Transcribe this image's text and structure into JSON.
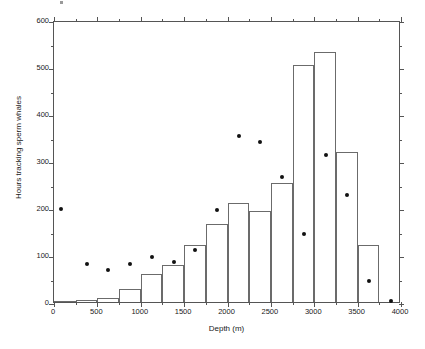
{
  "chart_data": {
    "type": "bar",
    "title": "",
    "xlabel": "Depth (m)",
    "ylabel": "Hours tracking sperm whales",
    "xlim": [
      0,
      4000
    ],
    "ylim": [
      0,
      600
    ],
    "grid": false,
    "legend": "none",
    "x_ticks_major": [
      0,
      500,
      1000,
      1500,
      2000,
      2500,
      3000,
      3500,
      4000
    ],
    "x_tick_labels": [
      "0",
      "500",
      "1000",
      "1500",
      "2000",
      "2500",
      "3000",
      "3500",
      "4000"
    ],
    "x_ticks_minor": [
      250,
      750,
      1250,
      1750,
      2250,
      2750,
      3250,
      3750
    ],
    "y_ticks_major": [
      0,
      100,
      200,
      300,
      400,
      500,
      600
    ],
    "y_tick_labels": [
      "0",
      "100",
      "200",
      "300",
      "400",
      "500",
      "600"
    ],
    "y_ticks_minor": [
      50,
      150,
      250,
      350,
      450,
      550
    ],
    "bin_width": 250,
    "bin_starts": [
      0,
      250,
      500,
      750,
      1000,
      1250,
      1500,
      1750,
      2000,
      2250,
      2500,
      2750,
      3000,
      3250,
      3500
    ],
    "bin_ends": [
      250,
      500,
      750,
      1000,
      1250,
      1500,
      1750,
      2000,
      2250,
      2500,
      2750,
      3000,
      3250,
      3500,
      3750
    ],
    "bin_centers": [
      125,
      375,
      625,
      875,
      1125,
      1375,
      1625,
      1875,
      2125,
      2375,
      2625,
      2875,
      3125,
      3375,
      3625
    ],
    "values": [
      1,
      4,
      8,
      27,
      59,
      79,
      121,
      165,
      210,
      194,
      253,
      504,
      532,
      319,
      121
    ],
    "series": [
      {
        "name": "Hours tracking sperm whales",
        "type": "bar",
        "values": [
          1,
          4,
          8,
          27,
          59,
          79,
          121,
          165,
          210,
          194,
          253,
          504,
          532,
          319,
          121
        ]
      },
      {
        "name": "scatter overlay",
        "type": "scatter",
        "points": [
          {
            "x": 80,
            "y": 198
          },
          {
            "x": 380,
            "y": 80
          },
          {
            "x": 620,
            "y": 68
          },
          {
            "x": 880,
            "y": 80
          },
          {
            "x": 1130,
            "y": 95
          },
          {
            "x": 1380,
            "y": 86
          },
          {
            "x": 1630,
            "y": 110
          },
          {
            "x": 1880,
            "y": 195
          },
          {
            "x": 2130,
            "y": 354
          },
          {
            "x": 2380,
            "y": 340
          },
          {
            "x": 2630,
            "y": 265
          },
          {
            "x": 2880,
            "y": 145
          },
          {
            "x": 3130,
            "y": 313
          },
          {
            "x": 3380,
            "y": 227
          },
          {
            "x": 3630,
            "y": 45
          },
          {
            "x": 3880,
            "y": 2
          }
        ]
      }
    ],
    "colors": {
      "bar_edge": "#6b6b6b",
      "bar_fill": "transparent",
      "marker": "#111111",
      "axis": "#555555",
      "background": "#ffffff"
    }
  }
}
